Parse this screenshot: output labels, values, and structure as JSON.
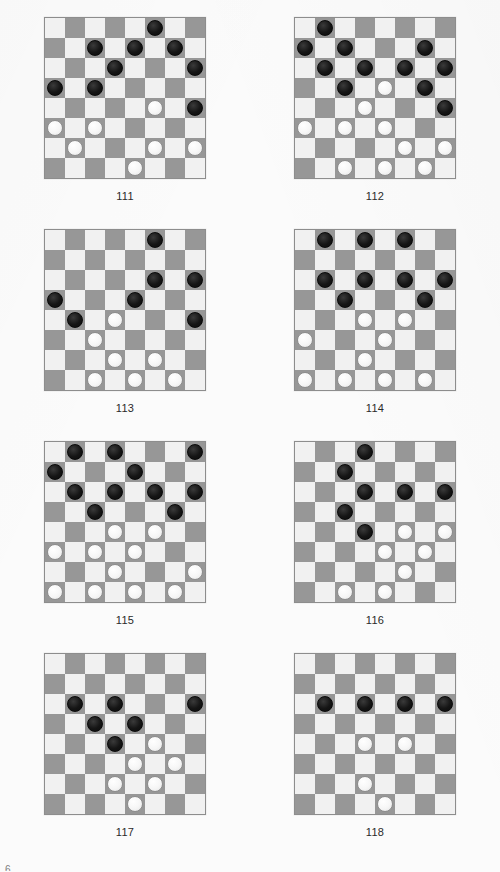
{
  "page": {
    "page_number": "6",
    "board_size": 8,
    "colors": {
      "page_background": "#fbfbfb",
      "light_square": "#f1f1f1",
      "dark_square": "#979797",
      "board_border": "#8d8d8d",
      "black_piece": "#151515",
      "white_piece": "#f6f6f6",
      "caption_text": "#2a2a2a"
    }
  },
  "chart_data": {
    "type": "table",
    "legend": [
      "black = black checker",
      "white = white checker"
    ]
  },
  "diagrams": [
    {
      "caption": "111",
      "black": [
        [
          0,
          5
        ],
        [
          1,
          2
        ],
        [
          1,
          4
        ],
        [
          1,
          6
        ],
        [
          2,
          3
        ],
        [
          2,
          7
        ],
        [
          3,
          0
        ],
        [
          3,
          2
        ],
        [
          4,
          7
        ]
      ],
      "white": [
        [
          4,
          5
        ],
        [
          5,
          0
        ],
        [
          5,
          2
        ],
        [
          6,
          1
        ],
        [
          6,
          5
        ],
        [
          6,
          7
        ],
        [
          7,
          4
        ]
      ]
    },
    {
      "caption": "112",
      "black": [
        [
          0,
          1
        ],
        [
          1,
          0
        ],
        [
          1,
          2
        ],
        [
          1,
          6
        ],
        [
          2,
          1
        ],
        [
          2,
          3
        ],
        [
          2,
          5
        ],
        [
          2,
          7
        ],
        [
          3,
          2
        ],
        [
          3,
          6
        ],
        [
          4,
          7
        ]
      ],
      "white": [
        [
          3,
          4
        ],
        [
          4,
          3
        ],
        [
          5,
          0
        ],
        [
          5,
          2
        ],
        [
          5,
          4
        ],
        [
          6,
          5
        ],
        [
          6,
          7
        ],
        [
          7,
          2
        ],
        [
          7,
          4
        ],
        [
          7,
          6
        ]
      ]
    },
    {
      "caption": "113",
      "black": [
        [
          0,
          5
        ],
        [
          2,
          5
        ],
        [
          2,
          7
        ],
        [
          3,
          0
        ],
        [
          3,
          4
        ],
        [
          4,
          1
        ],
        [
          4,
          7
        ]
      ],
      "white": [
        [
          4,
          3
        ],
        [
          5,
          2
        ],
        [
          6,
          3
        ],
        [
          6,
          5
        ],
        [
          7,
          2
        ],
        [
          7,
          4
        ],
        [
          7,
          6
        ]
      ]
    },
    {
      "caption": "114",
      "black": [
        [
          0,
          1
        ],
        [
          0,
          3
        ],
        [
          0,
          5
        ],
        [
          2,
          1
        ],
        [
          2,
          3
        ],
        [
          2,
          5
        ],
        [
          2,
          7
        ],
        [
          3,
          2
        ],
        [
          3,
          6
        ]
      ],
      "white": [
        [
          4,
          3
        ],
        [
          4,
          5
        ],
        [
          5,
          0
        ],
        [
          5,
          4
        ],
        [
          6,
          3
        ],
        [
          7,
          0
        ],
        [
          7,
          2
        ],
        [
          7,
          4
        ],
        [
          7,
          6
        ]
      ]
    },
    {
      "caption": "115",
      "black": [
        [
          0,
          1
        ],
        [
          0,
          3
        ],
        [
          0,
          7
        ],
        [
          1,
          0
        ],
        [
          1,
          4
        ],
        [
          2,
          1
        ],
        [
          2,
          3
        ],
        [
          2,
          5
        ],
        [
          2,
          7
        ],
        [
          3,
          2
        ],
        [
          3,
          6
        ]
      ],
      "white": [
        [
          4,
          3
        ],
        [
          4,
          5
        ],
        [
          5,
          0
        ],
        [
          5,
          2
        ],
        [
          5,
          4
        ],
        [
          6,
          3
        ],
        [
          6,
          7
        ],
        [
          7,
          0
        ],
        [
          7,
          2
        ],
        [
          7,
          4
        ],
        [
          7,
          6
        ]
      ]
    },
    {
      "caption": "116",
      "black": [
        [
          0,
          3
        ],
        [
          1,
          2
        ],
        [
          2,
          3
        ],
        [
          2,
          5
        ],
        [
          2,
          7
        ],
        [
          3,
          2
        ],
        [
          4,
          3
        ]
      ],
      "white": [
        [
          4,
          5
        ],
        [
          4,
          7
        ],
        [
          5,
          4
        ],
        [
          5,
          6
        ],
        [
          6,
          5
        ],
        [
          7,
          2
        ],
        [
          7,
          4
        ]
      ]
    },
    {
      "caption": "117",
      "black": [
        [
          2,
          1
        ],
        [
          2,
          3
        ],
        [
          2,
          7
        ],
        [
          3,
          2
        ],
        [
          3,
          4
        ],
        [
          4,
          3
        ]
      ],
      "white": [
        [
          4,
          5
        ],
        [
          5,
          4
        ],
        [
          5,
          6
        ],
        [
          6,
          3
        ],
        [
          6,
          5
        ],
        [
          7,
          4
        ]
      ]
    },
    {
      "caption": "118",
      "black": [
        [
          2,
          1
        ],
        [
          2,
          3
        ],
        [
          2,
          5
        ],
        [
          2,
          7
        ]
      ],
      "white": [
        [
          4,
          3
        ],
        [
          4,
          5
        ],
        [
          6,
          3
        ],
        [
          7,
          4
        ]
      ]
    }
  ]
}
